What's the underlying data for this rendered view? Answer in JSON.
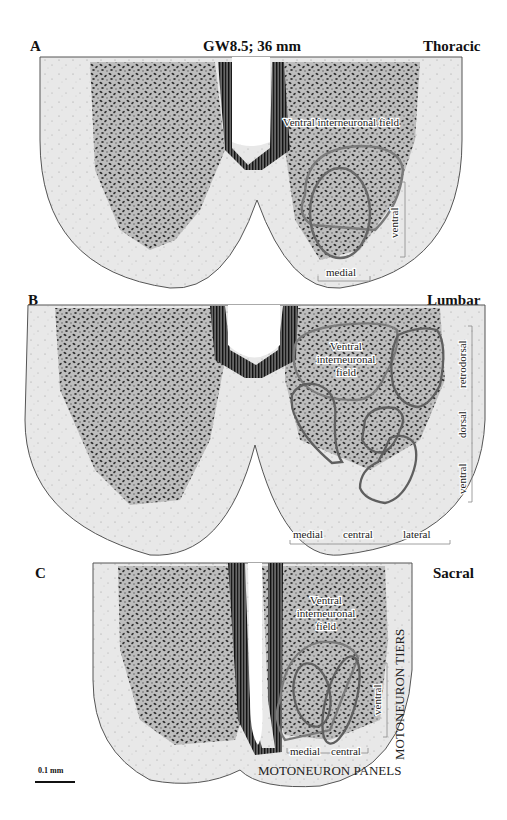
{
  "figure": {
    "title": "GW8.5; 36 mm",
    "scale_bar": "0.1 mm",
    "colors": {
      "tissue": "#e6e6e6",
      "cells": "#2a2a2a",
      "outline": "#6e6e6e",
      "background": "#ffffff"
    }
  },
  "panels": [
    {
      "letter": "A",
      "region": "Thoracic",
      "field_label": "Ventral interneuronal field",
      "tier_labels": [
        "ventral"
      ],
      "panel_labels": [
        "medial"
      ]
    },
    {
      "letter": "B",
      "region": "Lumbar",
      "field_label_lines": [
        "Ventral",
        "interneuronal",
        "field"
      ],
      "tier_labels": [
        "retrodorsal",
        "dorsal",
        "ventral"
      ],
      "panel_labels": [
        "medial",
        "central",
        "lateral"
      ]
    },
    {
      "letter": "C",
      "region": "Sacral",
      "field_label_lines": [
        "Ventral",
        "interneuronal",
        "field"
      ],
      "tier_labels": [
        "ventral"
      ],
      "panel_labels": [
        "medial",
        "central"
      ],
      "tiers_heading": "MOTONEURON TIERS",
      "panels_heading": "MOTONEURON PANELS"
    }
  ]
}
